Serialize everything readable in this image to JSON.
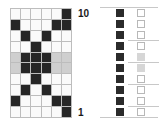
{
  "diagram": {
    "type": "binary-grid-pattern",
    "columns": 6,
    "rows": 10,
    "row_label_top": "10",
    "row_label_bottom": "1",
    "colors": {
      "dark": "#262626",
      "light": "#fafafa",
      "gray": "#cfcfcf"
    },
    "pattern": [
      [
        ".",
        ".",
        ".",
        ".",
        ".",
        "X"
      ],
      [
        "X",
        ".",
        ".",
        ".",
        "X",
        "X"
      ],
      [
        ".",
        "X",
        ".",
        "X",
        ".",
        "."
      ],
      [
        ".",
        ".",
        "X",
        ".",
        ".",
        "."
      ],
      [
        "g",
        "X",
        "X",
        "X",
        "g",
        "g"
      ],
      [
        "g",
        "X",
        "X",
        "X",
        "g",
        "g"
      ],
      [
        ".",
        ".",
        "X",
        ".",
        ".",
        "."
      ],
      [
        ".",
        "X",
        ".",
        "X",
        ".",
        "."
      ],
      [
        "X",
        ".",
        ".",
        ".",
        "X",
        "X"
      ],
      [
        ".",
        ".",
        ".",
        ".",
        ".",
        "X"
      ]
    ],
    "side_panel": {
      "dark_column": [
        "X",
        "X",
        "X",
        "X",
        "X",
        "X",
        "X",
        "X",
        "X",
        "X"
      ],
      "outline_column": [
        ".",
        ".",
        ".",
        ".",
        "g",
        "g",
        ".",
        ".",
        ".",
        "."
      ]
    }
  }
}
